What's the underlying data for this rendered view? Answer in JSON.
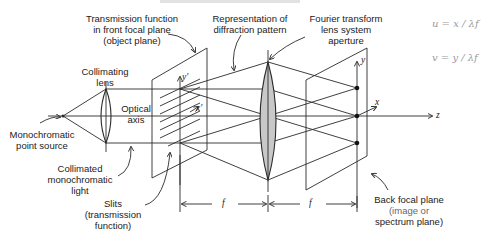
{
  "figure": {
    "labels": {
      "transmission": [
        "Transmission function",
        "in front focal plane",
        "(object plane)"
      ],
      "representation": [
        "Representation of",
        "diffraction pattern"
      ],
      "fourier": [
        "Fourier transform",
        "lens system",
        "aperture"
      ],
      "collimating_lens": [
        "Collimating",
        "lens"
      ],
      "optical_axis": [
        "Optical",
        "axis"
      ],
      "point_source": [
        "Monochromatic",
        "point source"
      ],
      "collimated_light": [
        "Collimated",
        "monochromatic",
        "light"
      ],
      "slits": [
        "Slits",
        "(transmission",
        "function)"
      ],
      "back_focal_plane": [
        "Back focal plane",
        "(image or",
        "spectrum plane)"
      ]
    },
    "axis_labels": {
      "y_prime": "y'",
      "x_prime": "x'",
      "y": "y",
      "x": "x",
      "z": "z",
      "f1": "f",
      "f2": "f"
    },
    "handwritten_notes": {
      "u_eq": "u = x / λf",
      "v_eq": "v = y / λf"
    },
    "colors": {
      "line": "#2a2a2a",
      "lens_fill": "#c8c8c8",
      "note": "#9a9a9a"
    }
  }
}
